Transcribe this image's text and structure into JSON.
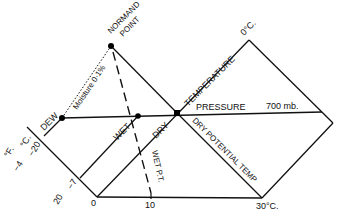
{
  "diagram": {
    "points": {
      "normand_label_1": "NORMAND",
      "normand_label_2": "POINT",
      "dew": "DEW",
      "wet": "WET",
      "dry": "DRY"
    },
    "lines": {
      "moisture": "Moisture 0·1%",
      "temperature": "TEMPERATURE",
      "top_temp": "0°C.",
      "pressure": "PRESSURE",
      "pressure_value": "700 mb.",
      "dry_potential": "DRY POTENTIAL TEMP",
      "wet_pt": "WET P.T."
    },
    "axis": {
      "unit_f": "°F.",
      "unit_c": "°C.",
      "f_minus4": "−4",
      "c_minus20": "−20",
      "f_20": "20",
      "c_minus7": "−7",
      "zero": "0",
      "ten": "10",
      "thirty": "30°C."
    },
    "colors": {
      "line": "#111111",
      "background": "#ffffff"
    }
  }
}
